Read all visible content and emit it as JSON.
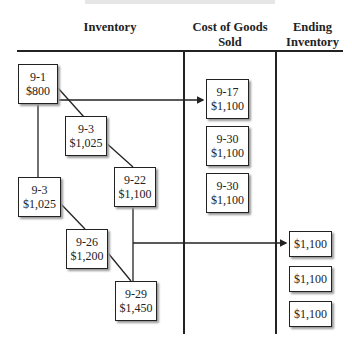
{
  "columns": {
    "inventory": "Inventory",
    "cogs_line1": "Cost of Goods",
    "cogs_line2": "Sold",
    "ending_line1": "Ending",
    "ending_line2": "Inventory"
  },
  "inventory_boxes": [
    {
      "date": "9-1",
      "amount": "$800"
    },
    {
      "date": "9-3",
      "amount": "$1,025"
    },
    {
      "date": "9-22",
      "amount": "$1,100"
    },
    {
      "date": "9-3",
      "amount": "$1,025"
    },
    {
      "date": "9-26",
      "amount": "$1,200"
    },
    {
      "date": "9-29",
      "amount": "$1,450"
    }
  ],
  "cogs_boxes": [
    {
      "date": "9-17",
      "amount": "$1,100"
    },
    {
      "date": "9-30",
      "amount": "$1,100"
    },
    {
      "date": "9-30",
      "amount": "$1,100"
    }
  ],
  "ending_boxes": [
    {
      "amount": "$1,100"
    },
    {
      "amount": "$1,100"
    },
    {
      "amount": "$1,100"
    }
  ],
  "colors": {
    "line": "#222222",
    "shadow": "#999999",
    "background": "#ffffff"
  }
}
